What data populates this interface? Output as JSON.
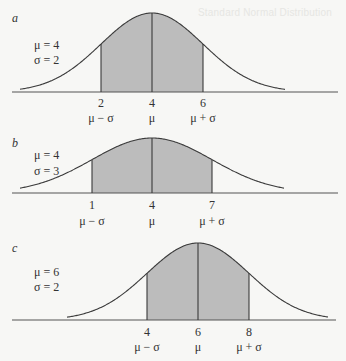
{
  "figure": {
    "bleed_through_text": "Standard Normal Distribution",
    "colors": {
      "background": "#f7f7f5",
      "shade": "#bcbcbc",
      "line": "#3a3a3a",
      "axis": "#555555"
    }
  },
  "chart_data": [
    {
      "type": "area",
      "panel": "a",
      "title": "a",
      "distribution": "normal",
      "mu": 4,
      "sigma": 2,
      "param_labels": [
        "μ = 4",
        "σ = 2"
      ],
      "shaded_interval": [
        2,
        6
      ],
      "ticks": [
        {
          "value": 2,
          "label": "2",
          "symbol": "μ − σ"
        },
        {
          "value": 4,
          "label": "4",
          "symbol": "μ"
        },
        {
          "value": 6,
          "label": "6",
          "symbol": "μ + σ"
        }
      ],
      "grid": false,
      "legend": "none",
      "layout": {
        "baseline_y": 92,
        "peak_y": 13,
        "mu_x": 152,
        "sigma_px": 51,
        "curve_x": [
          20,
          285
        ],
        "axis_x": [
          12,
          338
        ],
        "tick_label_y": 107,
        "symbol_y": 122,
        "letter_y": 22,
        "param_y": [
          49,
          64
        ],
        "param_x": 34
      }
    },
    {
      "type": "area",
      "panel": "b",
      "title": "b",
      "distribution": "normal",
      "mu": 4,
      "sigma": 3,
      "param_labels": [
        "μ = 4",
        "σ = 3"
      ],
      "shaded_interval": [
        1,
        7
      ],
      "ticks": [
        {
          "value": 1,
          "label": "1",
          "symbol": "μ − σ"
        },
        {
          "value": 4,
          "label": "4",
          "symbol": "μ"
        },
        {
          "value": 7,
          "label": "7",
          "symbol": "μ + σ"
        }
      ],
      "grid": false,
      "legend": "none",
      "layout": {
        "baseline_y": 193,
        "peak_y": 138,
        "mu_x": 152,
        "sigma_px": 60,
        "curve_x": [
          20,
          284
        ],
        "axis_x": [
          12,
          338
        ],
        "tick_label_y": 209,
        "symbol_y": 225,
        "letter_y": 147,
        "param_y": [
          159,
          175
        ],
        "param_x": 34
      }
    },
    {
      "type": "area",
      "panel": "c",
      "title": "c",
      "distribution": "normal",
      "mu": 6,
      "sigma": 2,
      "param_labels": [
        "μ = 6",
        "σ = 2"
      ],
      "shaded_interval": [
        4,
        8
      ],
      "ticks": [
        {
          "value": 4,
          "label": "4",
          "symbol": "μ − σ"
        },
        {
          "value": 6,
          "label": "6",
          "symbol": "μ"
        },
        {
          "value": 8,
          "label": "8",
          "symbol": "μ + σ"
        }
      ],
      "grid": false,
      "legend": "none",
      "layout": {
        "baseline_y": 320,
        "peak_y": 243,
        "mu_x": 198,
        "sigma_px": 51,
        "curve_x": [
          67,
          328
        ],
        "axis_x": [
          12,
          336
        ],
        "tick_label_y": 336,
        "symbol_y": 351,
        "letter_y": 252,
        "param_y": [
          276,
          291
        ],
        "param_x": 34
      }
    }
  ]
}
